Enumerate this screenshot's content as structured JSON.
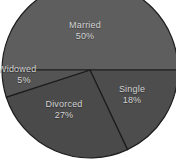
{
  "chart_data": {
    "type": "pie",
    "title": "",
    "xlabel": "",
    "ylabel": "",
    "legend_position": "none",
    "grid": false,
    "labels_inside_slices": true,
    "categories": [
      "Married",
      "Single",
      "Divorced",
      "Widowed"
    ],
    "values": [
      50,
      18,
      27,
      5
    ],
    "unit": "%",
    "start_angle_deg": 0,
    "direction": "clockwise",
    "slices": [
      {
        "name": "Married",
        "label": "Married",
        "percent_label": "50%",
        "value": 50,
        "start_angle_deg": 180,
        "end_angle_deg": 360,
        "color": "#5e5e5e"
      },
      {
        "name": "Single",
        "label": "Single",
        "percent_label": "18%",
        "value": 18,
        "start_angle_deg": 0,
        "end_angle_deg": 64.8,
        "color": "#4d4d4d"
      },
      {
        "name": "Divorced",
        "label": "Divorced",
        "percent_label": "27%",
        "value": 27,
        "start_angle_deg": 64.8,
        "end_angle_deg": 162,
        "color": "#4a4a4a"
      },
      {
        "name": "Widowed",
        "label": "Widowed",
        "percent_label": "5%",
        "value": 5,
        "start_angle_deg": 162,
        "end_angle_deg": 180,
        "color": "#545454"
      }
    ],
    "colors": {
      "background": "#ffffff",
      "married": "#5e5e5e",
      "single": "#4d4d4d",
      "divorced": "#4a4a4a",
      "widowed": "#545454",
      "slice_border": "#1c1c1c",
      "label_text": "#d2d2d2"
    },
    "geometry": {
      "center_x": 90,
      "center_y": 70,
      "radius": 88
    }
  }
}
